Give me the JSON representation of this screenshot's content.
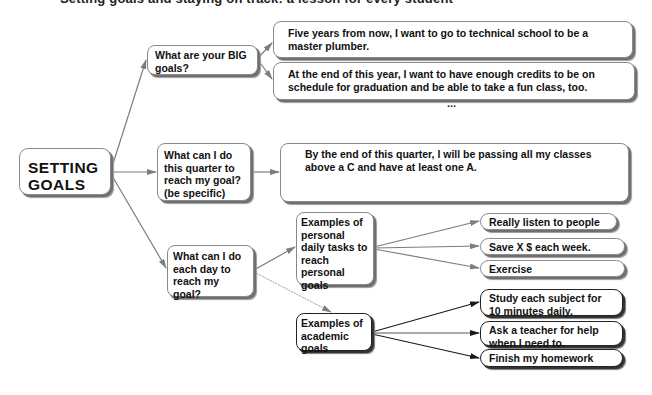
{
  "header": {
    "clipped_title": "Setting goals and staying on track: a lesson for every student"
  },
  "diagram": {
    "root": {
      "label": "SETTING\nGOALS",
      "line1": "SETTING",
      "line2": "GOALS"
    },
    "branches": [
      {
        "question": "What are your BIG goals?",
        "answers": [
          "Five years from now, I want to go to technical school to be a master plumber.",
          "At the end of this year, I want to have enough credits to be on schedule for graduation and be able to take a fun class, too."
        ],
        "more_indicator": "..."
      },
      {
        "question": "What can I do this quarter to reach my goal? (be specific)",
        "answers": [
          "By the end of this quarter, I will be passing all my classes above a C and have at least one A."
        ]
      },
      {
        "question": "What can I do each day to reach my goal?",
        "subgroups": [
          {
            "label": "Examples of personal daily tasks to reach personal goals",
            "items": [
              "Really listen to people",
              "Save X $ each week.",
              "Exercise"
            ]
          },
          {
            "label": "Examples of academic goals",
            "items": [
              "Study each subject for 10 minutes daily.",
              "Ask a teacher for help when I need to.",
              "Finish my homework"
            ]
          }
        ]
      }
    ]
  },
  "colors": {
    "line_gray": "#7d7d7d",
    "line_dark": "#1a1a1a",
    "box_border": "#8a8a8a",
    "shadow": "#6f6f6f",
    "text": "#111111"
  }
}
